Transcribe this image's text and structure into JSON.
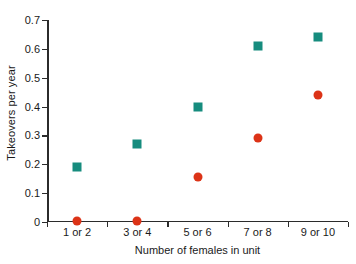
{
  "chart_data": {
    "type": "scatter",
    "title": "",
    "xlabel": "Number of females in unit",
    "ylabel": "Takeovers per year",
    "categories": [
      "1 or 2",
      "3 or 4",
      "5 or 6",
      "7 or 8",
      "9 or 10"
    ],
    "ylim": [
      0,
      0.7
    ],
    "y_ticks": [
      0,
      0.1,
      0.2,
      0.3,
      0.4,
      0.5,
      0.6,
      0.7
    ],
    "y_tick_labels": [
      "0",
      "0.1",
      "0.2",
      "0.3",
      "0.4",
      "0.5",
      "0.6",
      "0.7"
    ],
    "grid": false,
    "legend": "none",
    "series": [
      {
        "name": "teal-squares",
        "marker": "square",
        "color": "#168C7E",
        "values": [
          0.19,
          0.27,
          0.4,
          0.61,
          0.64
        ]
      },
      {
        "name": "red-circles",
        "marker": "circle",
        "color": "#DC3317",
        "values": [
          0.005,
          0.005,
          0.155,
          0.29,
          0.44
        ]
      }
    ]
  }
}
